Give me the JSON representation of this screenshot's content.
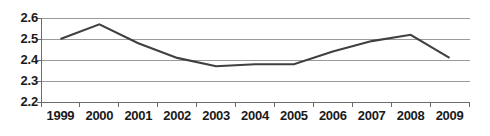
{
  "chart_data": {
    "type": "line",
    "title": "",
    "subtitle": "",
    "xlabel": "",
    "ylabel": "",
    "categories": [
      "1999",
      "2000",
      "2001",
      "2002",
      "2003",
      "2004",
      "2005",
      "2006",
      "2007",
      "2008",
      "2009"
    ],
    "values": [
      2.5,
      2.57,
      2.48,
      2.41,
      2.37,
      2.38,
      2.38,
      2.44,
      2.49,
      2.52,
      2.41
    ],
    "series": [
      {
        "name": "series-1",
        "values": [
          2.5,
          2.57,
          2.48,
          2.41,
          2.37,
          2.38,
          2.38,
          2.44,
          2.49,
          2.52,
          2.41
        ]
      }
    ],
    "ylim": [
      2.2,
      2.6
    ],
    "yticks": [
      2.6,
      2.5,
      2.4,
      2.3,
      2.2
    ],
    "ytick_labels": [
      "2.6",
      "2.5",
      "2.4",
      "2.3",
      "2.2"
    ],
    "grid": true,
    "grid_axis": "y",
    "legend": false,
    "legend_position": "none",
    "markers": false,
    "line_color": "#404040",
    "grid_color": "#9a9a9a",
    "axis_color": "#6b6b6b",
    "text_color": "#1a1a1a",
    "background_color": "#ffffff",
    "annotations": []
  },
  "axes": {
    "y_labels": [
      {
        "text": "2.6",
        "value": 2.6
      },
      {
        "text": "2.5",
        "value": 2.5
      },
      {
        "text": "2.4",
        "value": 2.4
      },
      {
        "text": "2.3",
        "value": 2.3
      },
      {
        "text": "2.2",
        "value": 2.2
      }
    ],
    "x_labels": [
      {
        "text": "1999"
      },
      {
        "text": "2000"
      },
      {
        "text": "2001"
      },
      {
        "text": "2002"
      },
      {
        "text": "2003"
      },
      {
        "text": "2004"
      },
      {
        "text": "2005"
      },
      {
        "text": "2006"
      },
      {
        "text": "2007"
      },
      {
        "text": "2008"
      },
      {
        "text": "2009"
      }
    ]
  }
}
